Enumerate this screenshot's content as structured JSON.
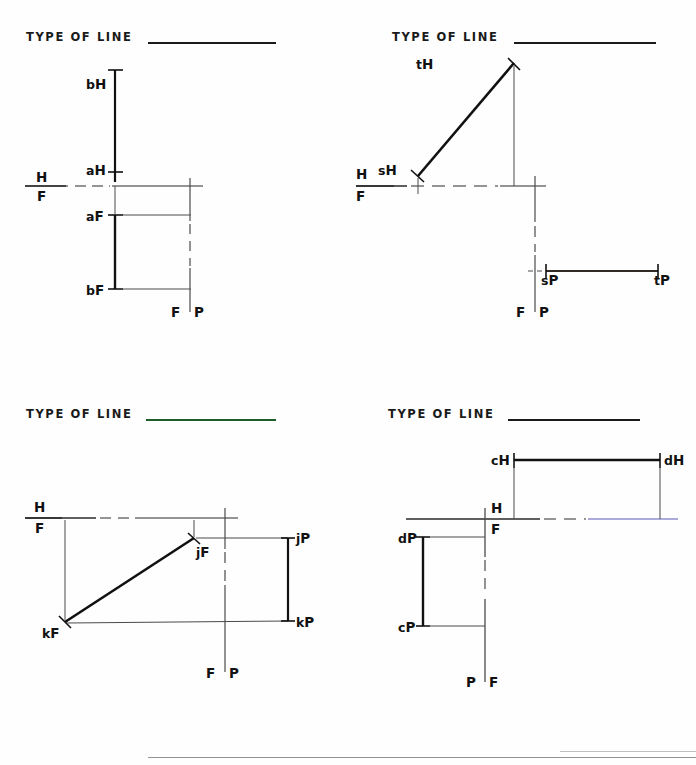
{
  "sheet": {
    "title_prompt": "TYPE  OF  LINE",
    "colors": {
      "ink": "#111111",
      "rule_black": "#1a1a1a",
      "rule_green": "#1d5c2a",
      "fold_blue": "#5a57b8",
      "thin_line": "#4a4a4a"
    }
  },
  "problems": [
    {
      "id": "problem-ab",
      "prompt": "TYPE  OF  LINE",
      "answer": "",
      "fold_labels": [
        {
          "name": "fold-label-h",
          "text": "H"
        },
        {
          "name": "fold-label-f",
          "text": "F"
        },
        {
          "name": "fold-label-fp-f",
          "text": "F"
        },
        {
          "name": "fold-label-fp-p",
          "text": "P"
        }
      ],
      "points": [
        {
          "name": "point-b-h",
          "letter": "b",
          "sub": "H"
        },
        {
          "name": "point-a-h",
          "letter": "a",
          "sub": "H"
        },
        {
          "name": "point-a-f",
          "letter": "a",
          "sub": "F"
        },
        {
          "name": "point-b-f",
          "letter": "b",
          "sub": "F"
        }
      ]
    },
    {
      "id": "problem-st",
      "prompt": "TYPE  OF  LINE",
      "answer": "",
      "fold_labels": [
        {
          "name": "fold-label-h",
          "text": "H"
        },
        {
          "name": "fold-label-f",
          "text": "F"
        },
        {
          "name": "fold-label-fp-f",
          "text": "F"
        },
        {
          "name": "fold-label-fp-p",
          "text": "P"
        }
      ],
      "points": [
        {
          "name": "point-t-h",
          "letter": "t",
          "sub": "H"
        },
        {
          "name": "point-s-h",
          "letter": "s",
          "sub": "H"
        },
        {
          "name": "point-s-p",
          "letter": "s",
          "sub": "P"
        },
        {
          "name": "point-t-p",
          "letter": "t",
          "sub": "P"
        }
      ]
    },
    {
      "id": "problem-jk",
      "prompt": "TYPE  OF  LINE",
      "answer": "",
      "fold_labels": [
        {
          "name": "fold-label-h",
          "text": "H"
        },
        {
          "name": "fold-label-f",
          "text": "F"
        },
        {
          "name": "fold-label-fp-f",
          "text": "F"
        },
        {
          "name": "fold-label-fp-p",
          "text": "P"
        }
      ],
      "points": [
        {
          "name": "point-j-f",
          "letter": "j",
          "sub": "F"
        },
        {
          "name": "point-k-f",
          "letter": "k",
          "sub": "F"
        },
        {
          "name": "point-j-p",
          "letter": "j",
          "sub": "P"
        },
        {
          "name": "point-k-p",
          "letter": "k",
          "sub": "P"
        }
      ]
    },
    {
      "id": "problem-cd",
      "prompt": "TYPE  OF  LINE",
      "answer": "",
      "fold_labels": [
        {
          "name": "fold-label-h",
          "text": "H"
        },
        {
          "name": "fold-label-f",
          "text": "F"
        },
        {
          "name": "fold-label-pf-p",
          "text": "P"
        },
        {
          "name": "fold-label-pf-f",
          "text": "F"
        }
      ],
      "points": [
        {
          "name": "point-c-h",
          "letter": "c",
          "sub": "H"
        },
        {
          "name": "point-d-h",
          "letter": "d",
          "sub": "H"
        },
        {
          "name": "point-d-p",
          "letter": "d",
          "sub": "P"
        },
        {
          "name": "point-c-p",
          "letter": "c",
          "sub": "P"
        }
      ]
    }
  ]
}
